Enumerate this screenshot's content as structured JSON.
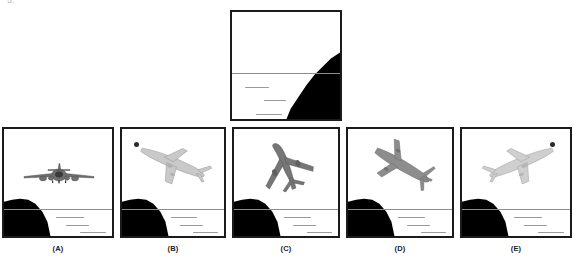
{
  "question": {
    "number_artifact": "5.",
    "type": "spatial-orientation-multiple-choice"
  },
  "reference": {
    "name": "reference-scene",
    "description": "Horizon with dark landmass cliff on the right side, calm water below with wave marks, no aircraft",
    "horizon_y_pct": 58,
    "land_side": "right",
    "waves": 3
  },
  "options": [
    {
      "id": "A",
      "label": "(A)",
      "aircraft": "airliner-head-on-level",
      "attitude": "wings level, viewed head-on",
      "land_side": "left",
      "has_sun_dot": false,
      "plane_tone": "#6f6f6f"
    },
    {
      "id": "B",
      "label": "(B)",
      "aircraft": "airliner-banked-light-outline",
      "attitude": "banked, nose down to the right",
      "land_side": "left",
      "has_sun_dot": true,
      "sun_dot_position": "upper-left",
      "plane_tone": "#b9b9b9"
    },
    {
      "id": "C",
      "label": "(C)",
      "aircraft": "airliner-climbing-from-below",
      "attitude": "steep climb, viewed from below and behind",
      "land_side": "left",
      "has_sun_dot": false,
      "plane_tone": "#767676"
    },
    {
      "id": "D",
      "label": "(D)",
      "aircraft": "airliner-banked-descending",
      "attitude": "banked diagonally, nose down to the right",
      "land_side": "left",
      "has_sun_dot": false,
      "plane_tone": "#8d8d8d"
    },
    {
      "id": "E",
      "label": "(E)",
      "aircraft": "airliner-banked-light-outline-mirrored",
      "attitude": "banked, nose up to the right",
      "land_side": "left",
      "has_sun_dot": true,
      "sun_dot_position": "upper-right",
      "plane_tone": "#c2c2c2"
    }
  ],
  "colors": {
    "frame": "#1b1b1b",
    "land": "#000000",
    "horizon": "#8e8e8e",
    "wave": "#9a9a9a",
    "background": "#ffffff",
    "sun_dot": "#2a2a2a",
    "label_text": "#222222"
  }
}
